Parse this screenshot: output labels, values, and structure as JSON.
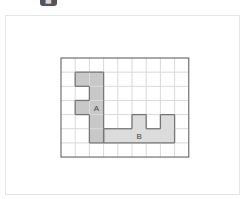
{
  "toolbar": {
    "left_text": "···",
    "button_icon": "image-icon"
  },
  "diagram": {
    "grid": {
      "cols": 9,
      "rows": 7
    },
    "colors": {
      "grid_line": "#d9d9d9",
      "border": "#555555",
      "shape_outline": "#777777",
      "shape_a_fill": "#c8c8c8",
      "shape_b_fill": "#dcdcdc",
      "label": "#444444"
    },
    "shapes": [
      {
        "id": "A",
        "label": "A",
        "fill_key": "shape_a_fill",
        "cells": [
          [
            1,
            1
          ],
          [
            2,
            1
          ],
          [
            2,
            2
          ],
          [
            1,
            3
          ],
          [
            2,
            3
          ],
          [
            2,
            4
          ],
          [
            2,
            5
          ]
        ],
        "label_cell": [
          2,
          3
        ]
      },
      {
        "id": "B",
        "label": "B",
        "fill_key": "shape_b_fill",
        "cells": [
          [
            3,
            5
          ],
          [
            4,
            5
          ],
          [
            5,
            5
          ],
          [
            6,
            5
          ],
          [
            7,
            5
          ],
          [
            5,
            4
          ],
          [
            7,
            4
          ]
        ],
        "label_cell": [
          5,
          5
        ]
      }
    ]
  }
}
